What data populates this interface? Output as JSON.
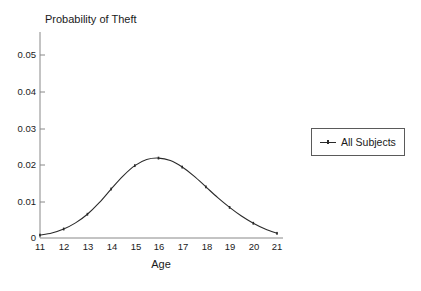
{
  "chart_data": {
    "type": "line",
    "title": "Probability of Theft",
    "xlabel": "Age",
    "ylabel": "",
    "xlim": [
      11,
      21
    ],
    "ylim": [
      0,
      0.055
    ],
    "grid": false,
    "legend_position": "right-outside",
    "x_ticks": [
      "11",
      "12",
      "13",
      "14",
      "15",
      "16",
      "17",
      "18",
      "19",
      "20",
      "21"
    ],
    "y_ticks": [
      "0",
      "0.01",
      "0.02",
      "0.03",
      "0.04",
      "0.05"
    ],
    "x_tick_values": [
      11,
      12,
      13,
      14,
      15,
      16,
      17,
      18,
      19,
      20,
      21
    ],
    "y_tick_values": [
      0,
      0.01,
      0.02,
      0.03,
      0.04,
      0.05
    ],
    "series": [
      {
        "name": "All Subjects",
        "color": "#2a2a2a",
        "x": [
          11,
          11.5,
          12,
          12.5,
          13,
          13.5,
          14,
          14.5,
          15,
          15.5,
          16,
          16.5,
          17,
          17.5,
          18,
          18.5,
          19,
          19.5,
          20,
          20.5,
          21
        ],
        "values": [
          0.0008,
          0.0014,
          0.0025,
          0.0042,
          0.0066,
          0.0098,
          0.0136,
          0.0172,
          0.0201,
          0.0218,
          0.0222,
          0.0215,
          0.0197,
          0.0172,
          0.0142,
          0.0112,
          0.0085,
          0.0061,
          0.0041,
          0.0025,
          0.0013
        ]
      }
    ]
  },
  "legend": {
    "entries": [
      {
        "label": "All Subjects"
      }
    ]
  }
}
